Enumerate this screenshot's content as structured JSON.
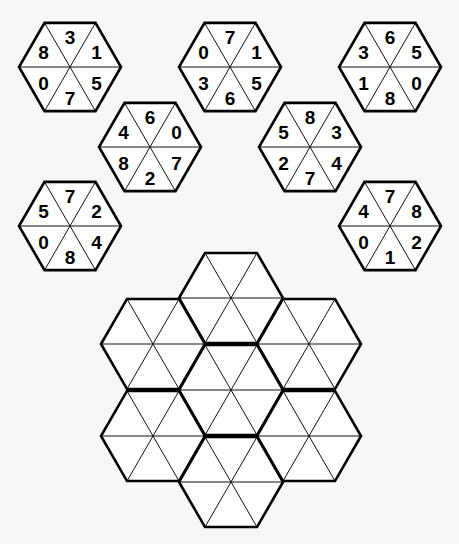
{
  "puzzle": {
    "type": "hexagon-tile-placement",
    "pieces": [
      {
        "id": "piece-1",
        "center": [
          70,
          67
        ],
        "segments": {
          "top": "3",
          "top_right": "1",
          "bottom_right": "5",
          "bottom": "7",
          "bottom_left": "0",
          "top_left": "8"
        }
      },
      {
        "id": "piece-2",
        "center": [
          230,
          67
        ],
        "segments": {
          "top": "7",
          "top_right": "1",
          "bottom_right": "5",
          "bottom": "6",
          "bottom_left": "3",
          "top_left": "0"
        }
      },
      {
        "id": "piece-3",
        "center": [
          390,
          67
        ],
        "segments": {
          "top": "6",
          "top_right": "5",
          "bottom_right": "0",
          "bottom": "8",
          "bottom_left": "1",
          "top_left": "3"
        }
      },
      {
        "id": "piece-4",
        "center": [
          150,
          147
        ],
        "segments": {
          "top": "6",
          "top_right": "0",
          "bottom_right": "7",
          "bottom": "2",
          "bottom_left": "8",
          "top_left": "4"
        }
      },
      {
        "id": "piece-5",
        "center": [
          310,
          147
        ],
        "segments": {
          "top": "8",
          "top_right": "3",
          "bottom_right": "4",
          "bottom": "7",
          "bottom_left": "2",
          "top_left": "5"
        }
      },
      {
        "id": "piece-6",
        "center": [
          70,
          226
        ],
        "segments": {
          "top": "7",
          "top_right": "2",
          "bottom_right": "4",
          "bottom": "8",
          "bottom_left": "0",
          "top_left": "5"
        }
      },
      {
        "id": "piece-7",
        "center": [
          390,
          226
        ],
        "segments": {
          "top": "7",
          "top_right": "8",
          "bottom_right": "2",
          "bottom": "1",
          "bottom_left": "0",
          "top_left": "4"
        }
      }
    ],
    "piece_radius": 51,
    "grid": {
      "slots": [
        {
          "id": "slot-top",
          "center": [
            231,
            298
          ]
        },
        {
          "id": "slot-upper-left",
          "center": [
            153,
            344
          ]
        },
        {
          "id": "slot-upper-right",
          "center": [
            309,
            344
          ]
        },
        {
          "id": "slot-center",
          "center": [
            231,
            390
          ]
        },
        {
          "id": "slot-lower-left",
          "center": [
            153,
            436
          ]
        },
        {
          "id": "slot-lower-right",
          "center": [
            309,
            436
          ]
        },
        {
          "id": "slot-bottom",
          "center": [
            231,
            482
          ]
        }
      ],
      "slot_radius": 52
    },
    "colors": {
      "background": "#f7f7f7",
      "fill": "#ffffff",
      "line": "#000000"
    }
  }
}
